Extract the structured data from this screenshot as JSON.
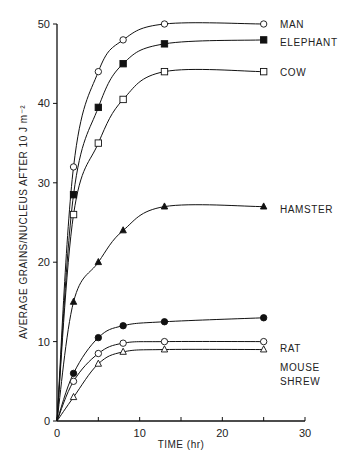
{
  "chart_data": {
    "type": "line",
    "title": "",
    "xlabel": "TIME (hr)",
    "ylabel": "AVERAGE GRAINS/NUCLEUS AFTER 10 J m⁻²",
    "xlim": [
      0,
      30
    ],
    "ylim": [
      0,
      50
    ],
    "xticks": [
      0,
      10,
      20,
      30
    ],
    "yticks": [
      0,
      10,
      20,
      30,
      40,
      50
    ],
    "grid": false,
    "legend_position": "inline-right",
    "x": [
      0,
      2,
      5,
      8,
      13,
      25
    ],
    "series": [
      {
        "name": "MAN",
        "marker": "open-circle",
        "values": [
          0,
          32,
          44,
          48,
          50,
          50
        ]
      },
      {
        "name": "ELEPHANT",
        "marker": "filled-square",
        "values": [
          0,
          28.5,
          39.5,
          45,
          47.5,
          48
        ]
      },
      {
        "name": "COW",
        "marker": "open-square",
        "values": [
          0,
          26,
          35,
          40.5,
          44,
          44
        ]
      },
      {
        "name": "HAMSTER",
        "marker": "filled-triangle",
        "values": [
          0,
          15,
          20,
          24,
          27,
          27
        ]
      },
      {
        "name": "RAT",
        "marker": "filled-circle",
        "values": [
          0,
          6,
          10.5,
          12,
          12.5,
          13
        ]
      },
      {
        "name": "MOUSE",
        "marker": "open-circle",
        "values": [
          0,
          5,
          8.5,
          9.8,
          10,
          10
        ]
      },
      {
        "name": "SHREW",
        "marker": "open-triangle",
        "values": [
          0,
          3,
          7.2,
          8.7,
          9,
          9
        ]
      }
    ]
  }
}
